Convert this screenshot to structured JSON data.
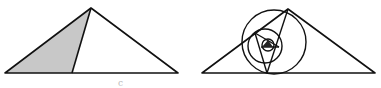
{
  "figures": [
    {
      "id": "left",
      "description": "Triangle with a cevian from the apex; left sub-triangle shaded gray",
      "outer_triangle": [
        [
          5,
          73
        ],
        [
          91,
          8
        ],
        [
          178,
          73
        ]
      ],
      "cevian": [
        [
          91,
          8
        ],
        [
          72,
          73
        ]
      ],
      "shaded_region": [
        [
          5,
          73
        ],
        [
          91,
          8
        ],
        [
          72,
          73
        ]
      ],
      "shade_color": "#c8c8c8",
      "stroke_color": "#111111"
    },
    {
      "id": "right",
      "description": "Same triangle with nested cevians and circles (iterated construction)",
      "outer_triangle": [
        [
          202,
          73
        ],
        [
          288,
          9
        ],
        [
          375,
          73
        ]
      ],
      "cevians": [
        [
          [
            288,
            9
          ],
          [
            267,
            73
          ]
        ],
        [
          [
            267,
            73
          ],
          [
            255,
            33
          ]
        ],
        [
          [
            255,
            33
          ],
          [
            278,
            47
          ]
        ],
        [
          [
            278,
            47
          ],
          [
            264,
            40
          ]
        ]
      ],
      "circles": [
        {
          "cx": 274,
          "cy": 42,
          "r": 32
        },
        {
          "cx": 265,
          "cy": 46,
          "r": 17
        },
        {
          "cx": 268,
          "cy": 45,
          "r": 7
        }
      ],
      "stroke_color": "#111111"
    }
  ],
  "caption": {
    "text": "c"
  }
}
